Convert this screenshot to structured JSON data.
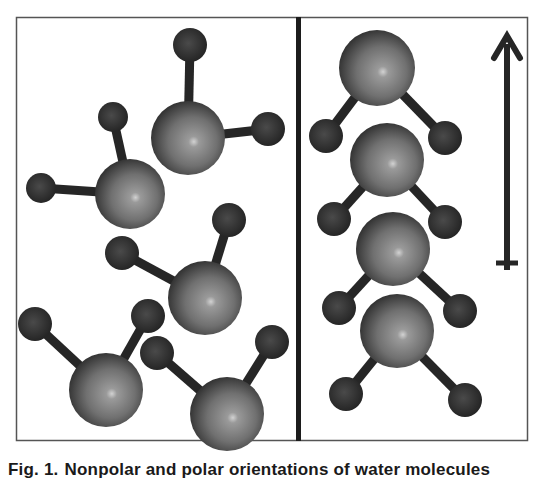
{
  "figure": {
    "label": "Fig. 1.",
    "caption_text": "Nonpolar and polar orientations of water molecules",
    "panels": [
      {
        "id": "left",
        "description": "random (nonpolar) orientation of water molecules",
        "molecules": [
          {
            "O": [
              188,
              138,
              37
            ],
            "H": [
              [
                190,
                45,
                17
              ],
              [
                268,
                129,
                17
              ]
            ]
          },
          {
            "O": [
              130,
              194,
              35
            ],
            "H": [
              [
                113,
                117,
                15
              ],
              [
                41,
                188,
                15
              ]
            ]
          },
          {
            "O": [
              205,
              298,
              37
            ],
            "H": [
              [
                229,
                220,
                17
              ],
              [
                122,
                253,
                17
              ]
            ]
          },
          {
            "O": [
              106,
              390,
              37
            ],
            "H": [
              [
                35,
                324,
                17
              ],
              [
                148,
                316,
                17
              ]
            ]
          },
          {
            "O": [
              227,
              414,
              37
            ],
            "H": [
              [
                157,
                353,
                17
              ],
              [
                272,
                342,
                17
              ]
            ]
          }
        ]
      },
      {
        "id": "right",
        "description": "aligned (polar) orientation of water molecules",
        "molecules": [
          {
            "O": [
              377,
              68,
              38
            ],
            "H": [
              [
                326,
                136,
                17
              ],
              [
                445,
                138,
                17
              ]
            ]
          },
          {
            "O": [
              387,
              160,
              37
            ],
            "H": [
              [
                334,
                219,
                17
              ],
              [
                445,
                222,
                17
              ]
            ]
          },
          {
            "O": [
              393,
              249,
              37
            ],
            "H": [
              [
                339,
                308,
                17
              ],
              [
                460,
                311,
                17
              ]
            ]
          },
          {
            "O": [
              397,
              331,
              37
            ],
            "H": [
              [
                346,
                394,
                17
              ],
              [
                465,
                400,
                17
              ]
            ]
          }
        ],
        "arrow": {
          "direction": "up",
          "icon": "field-direction-arrow-icon"
        }
      }
    ],
    "colors": {
      "frame": "#555555",
      "divider": "#1c1c1c",
      "oxygen_light": "#b8b8b8",
      "oxygen_mid": "#7a7a7a",
      "oxygen_dark": "#2e2e2e",
      "hydrogen": "#333333",
      "bond": "#262626",
      "arrow": "#262626"
    }
  }
}
